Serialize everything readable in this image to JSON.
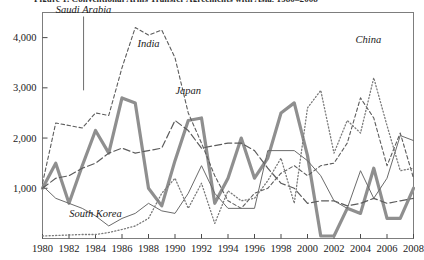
{
  "figure": {
    "cut_off_title": "Figure 1. Conventional Arms Transfer Agreements with Asia, 1980–2008"
  },
  "chart_data": {
    "type": "line",
    "title": "",
    "subtitle": "",
    "xlabel": "",
    "ylabel": "",
    "grid": false,
    "legend_position": "inline-annotations",
    "xlim": [
      1980,
      2008
    ],
    "ylim": [
      0,
      4500
    ],
    "ytick_labels": [
      "1,000",
      "2,000",
      "3,000",
      "4,000"
    ],
    "ytick_values": [
      1000,
      2000,
      3000,
      4000
    ],
    "xtick_labels": [
      "1980",
      "1982",
      "1984",
      "1986",
      "1988",
      "1990",
      "1992",
      "1994",
      "1996",
      "1998",
      "2000",
      "2002",
      "2004",
      "2006",
      "2008"
    ],
    "xtick_values": [
      1980,
      1982,
      1984,
      1986,
      1988,
      1990,
      1992,
      1994,
      1996,
      1998,
      2000,
      2002,
      2004,
      2006,
      2008
    ],
    "x": [
      1980,
      1981,
      1982,
      1983,
      1984,
      1985,
      1986,
      1987,
      1988,
      1989,
      1990,
      1991,
      1992,
      1993,
      1994,
      1995,
      1996,
      1997,
      1998,
      1999,
      2000,
      2001,
      2002,
      2003,
      2004,
      2005,
      2006,
      2007,
      2008
    ],
    "series": [
      {
        "name": "Saudi Arabia",
        "style": "thick-solid",
        "color": "#8f8f8f",
        "width": 3.2,
        "values": [
          1000,
          1500,
          700,
          1450,
          2150,
          1700,
          2800,
          2700,
          1000,
          650,
          1550,
          2350,
          2400,
          700,
          1200,
          2000,
          1200,
          1600,
          2500,
          2700,
          1650,
          50,
          50,
          600,
          500,
          1400,
          400,
          400,
          1000
        ]
      },
      {
        "name": "India",
        "style": "short-dash",
        "color": "#5c5c5c",
        "width": 1.1,
        "values": [
          1100,
          2300,
          2250,
          2200,
          2500,
          2450,
          3400,
          4200,
          4050,
          4150,
          3600,
          2500,
          1900,
          1250,
          750,
          600,
          900,
          1000,
          1300,
          1450,
          1250,
          1450,
          1500,
          1900,
          2800,
          2400,
          1450,
          2100,
          1200
        ]
      },
      {
        "name": "Japan",
        "style": "long-dash",
        "color": "#5c5c5c",
        "width": 1.2,
        "values": [
          1000,
          1200,
          1250,
          1400,
          1500,
          1700,
          1800,
          1700,
          1750,
          1800,
          2350,
          2150,
          1800,
          1850,
          1900,
          1900,
          1750,
          1400,
          1100,
          1000,
          700,
          750,
          750,
          650,
          700,
          800,
          700,
          750,
          800
        ]
      },
      {
        "name": "South Korea",
        "style": "thin-solid",
        "color": "#6b6b6b",
        "width": 1.0,
        "values": [
          1050,
          800,
          700,
          600,
          450,
          250,
          400,
          500,
          700,
          550,
          500,
          900,
          1450,
          900,
          600,
          600,
          600,
          1750,
          1750,
          1750,
          1550,
          1250,
          750,
          600,
          1350,
          800,
          1200,
          2050,
          1950
        ]
      },
      {
        "name": "China",
        "style": "dotted",
        "color": "#7a7a7a",
        "width": 1.3,
        "values": [
          50,
          60,
          70,
          80,
          80,
          120,
          180,
          250,
          400,
          900,
          1200,
          600,
          1100,
          300,
          950,
          750,
          800,
          1150,
          1600,
          700,
          2600,
          2950,
          1700,
          2350,
          2100,
          3200,
          2250,
          1350,
          1400
        ]
      }
    ],
    "annotations": [
      {
        "label": "Saudi Arabia",
        "x": 1983.1,
        "y": 4500,
        "leader": true
      },
      {
        "label": "India",
        "x": 1988.0,
        "y": 3820,
        "leader": false
      },
      {
        "label": "Japan",
        "x": 1991.0,
        "y": 2880,
        "leader": false
      },
      {
        "label": "China",
        "x": 2004.6,
        "y": 3900,
        "leader": false
      },
      {
        "label": "South Korea",
        "x": 1984.0,
        "y": 420,
        "leader": false
      }
    ]
  }
}
